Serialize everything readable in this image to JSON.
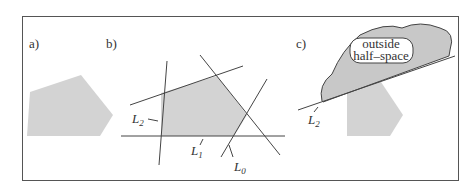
{
  "panels": {
    "a": {
      "label": "a)"
    },
    "b": {
      "label": "b)",
      "lines": [
        {
          "name": "L",
          "sub": "2"
        },
        {
          "name": "L",
          "sub": "1"
        },
        {
          "name": "L",
          "sub": "0"
        }
      ]
    },
    "c": {
      "label": "c)",
      "region_text_1": "outside",
      "region_text_2": "half–space",
      "line": {
        "name": "L",
        "sub": "2"
      }
    }
  },
  "colors": {
    "fill": "#d3d3d3",
    "stroke": "#444444",
    "frame": "#555555"
  }
}
